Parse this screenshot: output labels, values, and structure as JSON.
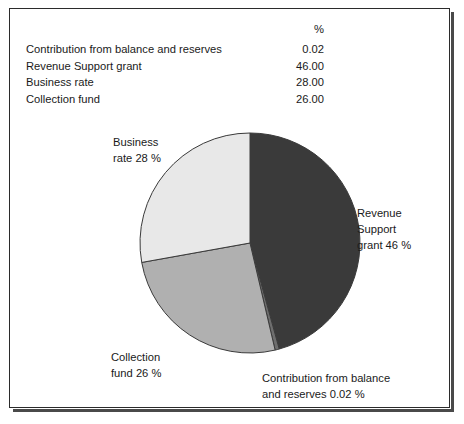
{
  "table": {
    "header": {
      "label": "",
      "value": "%"
    },
    "rows": [
      {
        "label": "Contribution from balance and reserves",
        "value": "0.02"
      },
      {
        "label": "Revenue Support grant",
        "value": "46.00"
      },
      {
        "label": "Business rate",
        "value": "28.00"
      },
      {
        "label": "Collection fund",
        "value": "26.00"
      }
    ]
  },
  "labels": {
    "business_rate": {
      "line1": "Business",
      "line2": "rate 28 %"
    },
    "revenue_support": {
      "line1": "Revenue",
      "line2": "Support",
      "line3": "grant 46 %"
    },
    "collection_fund": {
      "line1": "Collection",
      "line2": "fund 26 %"
    },
    "contribution": {
      "line1": "Contribution from balance",
      "line2": "and reserves 0.02 %"
    }
  },
  "chart_data": {
    "type": "pie",
    "title": "",
    "unit": "%",
    "start_angle_deg": 0,
    "direction": "clockwise",
    "legend": "labels-outside",
    "grid": false,
    "categories": [
      "Revenue Support grant",
      "Contribution from balance and reserves",
      "Collection fund",
      "Business rate"
    ],
    "values": [
      46.0,
      0.02,
      26.0,
      28.0
    ],
    "colors": [
      "#3a3a3a",
      "#6e6e6e",
      "#b0b0b0",
      "#e8e8e8"
    ],
    "stroke": "#3a3a3a",
    "center": [
      240,
      234
    ],
    "radius": 110
  }
}
